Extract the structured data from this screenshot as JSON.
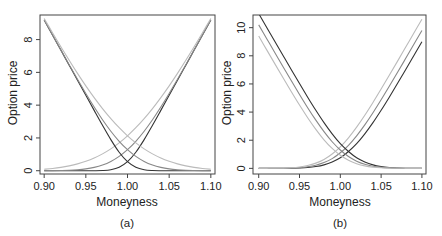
{
  "chart_data": [
    {
      "type": "line",
      "panel_label": "(a)",
      "title": "",
      "xlabel": "Moneyness",
      "ylabel": "Option price",
      "xlim": [
        0.895,
        1.105
      ],
      "ylim": [
        -0.2,
        9.5
      ],
      "xticks": [
        0.9,
        0.95,
        1.0,
        1.05,
        1.1
      ],
      "xtick_labels": [
        "0.90",
        "0.95",
        "1.00",
        "1.05",
        "1.10"
      ],
      "yticks": [
        0,
        2,
        4,
        6,
        8
      ],
      "ytick_labels": [
        "0",
        "2",
        "4",
        "6",
        "8"
      ],
      "grid": false,
      "x": [
        0.9,
        0.91,
        0.92,
        0.93,
        0.94,
        0.95,
        0.96,
        0.97,
        0.98,
        0.99,
        1.0,
        1.01,
        1.02,
        1.03,
        1.04,
        1.05,
        1.06,
        1.07,
        1.08,
        1.09,
        1.1
      ],
      "series": [
        {
          "name": "call-low-vol",
          "color": "#333333",
          "values": [
            0,
            0,
            0,
            0,
            0,
            0,
            0.002,
            0.012,
            0.059,
            0.208,
            0.55,
            1.128,
            1.899,
            2.772,
            3.682,
            4.6,
            5.52,
            6.44,
            7.36,
            8.28,
            9.2
          ]
        },
        {
          "name": "call-mid-vol",
          "color": "#888888",
          "values": [
            0.002,
            0.005,
            0.013,
            0.027,
            0.057,
            0.111,
            0.204,
            0.349,
            0.569,
            0.876,
            1.284,
            1.796,
            2.409,
            3.109,
            3.884,
            4.711,
            5.577,
            6.467,
            7.373,
            8.285,
            9.202
          ]
        },
        {
          "name": "call-high-vol",
          "color": "#bbbbbb",
          "values": [
            0.091,
            0.139,
            0.205,
            0.297,
            0.417,
            0.574,
            0.775,
            1.028,
            1.334,
            1.702,
            2.129,
            2.622,
            3.174,
            3.788,
            4.455,
            5.174,
            5.937,
            6.737,
            7.565,
            8.419,
            9.291
          ]
        },
        {
          "name": "put-low-vol",
          "color": "#333333",
          "values": [
            9.2,
            8.28,
            7.36,
            6.44,
            5.52,
            4.6,
            3.682,
            2.772,
            1.899,
            1.128,
            0.55,
            0.208,
            0.059,
            0.012,
            0.002,
            0,
            0,
            0,
            0,
            0,
            0
          ]
        },
        {
          "name": "put-mid-vol",
          "color": "#888888",
          "values": [
            9.202,
            8.285,
            7.373,
            6.467,
            5.577,
            4.711,
            3.884,
            3.109,
            2.409,
            1.796,
            1.284,
            0.876,
            0.569,
            0.349,
            0.204,
            0.111,
            0.057,
            0.027,
            0.013,
            0.005,
            0.002
          ]
        },
        {
          "name": "put-high-vol",
          "color": "#bbbbbb",
          "values": [
            9.291,
            8.419,
            7.565,
            6.737,
            5.937,
            5.174,
            4.455,
            3.788,
            3.174,
            2.622,
            2.129,
            1.702,
            1.334,
            1.028,
            0.775,
            0.574,
            0.417,
            0.297,
            0.205,
            0.139,
            0.091
          ]
        }
      ]
    },
    {
      "type": "line",
      "panel_label": "(b)",
      "title": "",
      "xlabel": "Moneyness",
      "ylabel": "Option price",
      "xlim": [
        0.893,
        1.105
      ],
      "ylim": [
        -0.4,
        10.9
      ],
      "xticks": [
        0.9,
        0.95,
        1.0,
        1.05,
        1.1
      ],
      "xtick_labels": [
        "0.90",
        "0.95",
        "1.00",
        "1.05",
        "1.10"
      ],
      "yticks": [
        0,
        2,
        4,
        6,
        8,
        10
      ],
      "ytick_labels": [
        "0",
        "2",
        "4",
        "6",
        "8",
        "10"
      ],
      "grid": false,
      "x": [
        0.9,
        0.91,
        0.92,
        0.93,
        0.94,
        0.95,
        0.96,
        0.97,
        0.98,
        0.99,
        1.0,
        1.01,
        1.02,
        1.03,
        1.04,
        1.05,
        1.06,
        1.07,
        1.08,
        1.09,
        1.1
      ],
      "series": [
        {
          "name": "call-dark",
          "color": "#333333",
          "values": [
            0,
            0,
            0.001,
            0.004,
            0.01,
            0.026,
            0.059,
            0.127,
            0.25,
            0.453,
            0.752,
            1.197,
            1.752,
            2.453,
            3.25,
            4.127,
            5.059,
            6.026,
            7.01,
            8.004,
            9.001
          ]
        },
        {
          "name": "call-mid",
          "color": "#888888",
          "values": [
            0,
            0.001,
            0.003,
            0.009,
            0.023,
            0.052,
            0.113,
            0.225,
            0.412,
            0.692,
            1.108,
            1.641,
            2.313,
            3.091,
            3.952,
            4.873,
            5.833,
            6.813,
            7.805,
            8.802,
            9.8
          ]
        },
        {
          "name": "call-light",
          "color": "#bbbbbb",
          "values": [
            0.001,
            0.003,
            0.008,
            0.02,
            0.046,
            0.1,
            0.201,
            0.372,
            0.632,
            1.019,
            1.53,
            2.173,
            2.932,
            3.776,
            4.686,
            5.639,
            6.616,
            7.606,
            8.603,
            9.6,
            10.6
          ]
        },
        {
          "name": "put-dark",
          "color": "#333333",
          "values": [
            11.0,
            10.0,
            9.001,
            8.004,
            7.01,
            6.026,
            5.059,
            4.127,
            3.25,
            2.453,
            1.752,
            1.197,
            0.752,
            0.453,
            0.25,
            0.127,
            0.059,
            0.026,
            0.01,
            0.004,
            0.001
          ]
        },
        {
          "name": "put-mid",
          "color": "#888888",
          "values": [
            10.2,
            9.201,
            8.203,
            7.209,
            6.223,
            5.252,
            4.313,
            3.425,
            2.612,
            1.892,
            1.308,
            0.841,
            0.513,
            0.291,
            0.152,
            0.073,
            0.033,
            0.013,
            0.005,
            0.002,
            0
          ]
        },
        {
          "name": "put-light",
          "color": "#bbbbbb",
          "values": [
            9.401,
            8.403,
            7.408,
            6.42,
            5.446,
            4.5,
            3.601,
            2.772,
            2.032,
            1.419,
            0.93,
            0.573,
            0.332,
            0.176,
            0.086,
            0.039,
            0.016,
            0.006,
            0.003,
            0,
            0
          ]
        }
      ]
    }
  ]
}
